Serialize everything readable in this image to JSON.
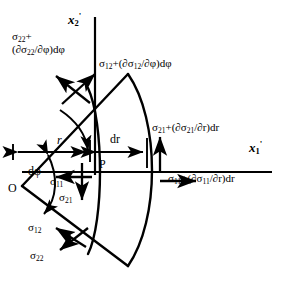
{
  "figure": {
    "stroke_color": "#000000",
    "background_color": "#ffffff"
  },
  "axes": {
    "x1": {
      "label_base": "x",
      "label_sub": "1",
      "label_prime": "'",
      "name": "x1-prime-axis"
    },
    "x2": {
      "label_base": "x",
      "label_sub": "2",
      "label_prime": "'",
      "name": "x2-prime-axis"
    }
  },
  "points": {
    "origin": "O",
    "element_point": "P"
  },
  "dimensions": {
    "radius": "r",
    "radial_increment": "dr",
    "angle_increment": "dφ"
  },
  "stresses": {
    "sigma22_plus": {
      "line1": "σ",
      "line1_sub": "22",
      "line1_tail": "+",
      "line2": "(∂σ",
      "line2_sub": "22",
      "line2_tail": "/∂φ)dφ"
    },
    "sigma12_plus": {
      "head": "σ",
      "head_sub": "12",
      "mid": "+(∂σ",
      "mid_sub": "12",
      "tail": "/∂φ)dφ"
    },
    "sigma21_plus": {
      "head": "σ",
      "head_sub": "21",
      "mid": "+(∂σ",
      "mid_sub": "21",
      "tail": "/∂r)dr"
    },
    "sigma11_plus": {
      "head": "σ",
      "head_sub": "11",
      "mid": "+(∂σ",
      "mid_sub": "11",
      "tail": "/∂r)dr"
    },
    "sigma11": {
      "base": "σ",
      "sub": "11"
    },
    "sigma21": {
      "base": "σ",
      "sub": "21"
    },
    "sigma12": {
      "base": "σ",
      "sub": "12"
    },
    "sigma22": {
      "base": "σ",
      "sub": "22"
    }
  }
}
